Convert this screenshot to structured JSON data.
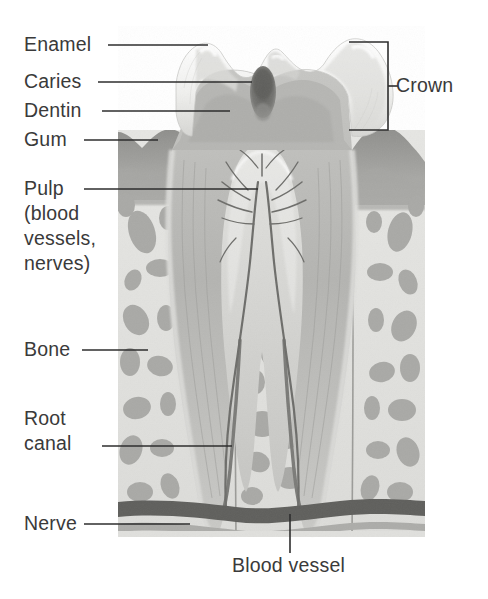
{
  "figure": {
    "type": "anatomical-illustration"
  },
  "labels": {
    "enamel": "Enamel",
    "caries": "Caries",
    "dentin": "Dentin",
    "gum": "Gum",
    "pulp_line1": "Pulp",
    "pulp_line2": "(blood",
    "pulp_line3": "vessels,",
    "pulp_line4": "nerves)",
    "bone": "Bone",
    "root_canal_line1": "Root",
    "root_canal_line2": "canal",
    "nerve": "Nerve",
    "crown": "Crown",
    "blood_vessel": "Blood vessel"
  },
  "colors": {
    "background": "#ffffff",
    "text": "#3a3a3a",
    "leader_line": "#2e2e2e",
    "enamel": "#f2f2f0",
    "enamel_shade": "#d9d9d6",
    "dentin": "#b9b9b6",
    "dentin_dark": "#a3a3a0",
    "pulp": "#cfcfcc",
    "caries": "#6e6e6b",
    "gum": "#9a9a97",
    "bone_matrix": "#e3e3e0",
    "bone_trabecula": "#a8a8a5",
    "vessel_dark": "#5c5c59",
    "nerve_band": "#b0b0ad",
    "canal": "#6b6b68"
  }
}
